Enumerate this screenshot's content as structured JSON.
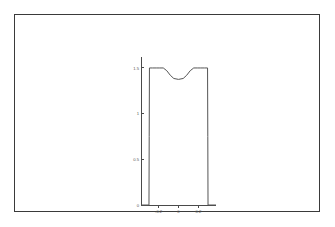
{
  "figure": {
    "title": "",
    "frame_color": "#3a3a3a",
    "background": "#ffffff",
    "line_color": "#555555"
  },
  "chart_data": {
    "type": "line",
    "title": "",
    "xlabel": "",
    "ylabel": "",
    "xlim": [
      -0.32,
      0.32
    ],
    "ylim": [
      0,
      1.62
    ],
    "grid": false,
    "legend": null,
    "xticks": [
      -0.2,
      0,
      0.2
    ],
    "xticklabels": [
      "-0.2",
      "0",
      "0.2"
    ],
    "yticks": [
      0,
      0.5,
      1,
      1.5
    ],
    "yticklabels": [
      "0",
      "0.5",
      "1",
      "1.5"
    ],
    "series": [
      {
        "name": "u(x)",
        "comment": "square-well profile: zero outside the support, flat near 1.5 with a shallow central dip",
        "x": [
          -0.32,
          -0.252,
          -0.25,
          -0.248,
          -0.22,
          -0.19,
          -0.16,
          -0.13,
          -0.1,
          -0.07,
          -0.04,
          0.0,
          0.04,
          0.07,
          0.1,
          0.13,
          0.16,
          0.19,
          0.22,
          0.248,
          0.25,
          0.252,
          0.32
        ],
        "y": [
          0.0,
          0.0,
          0.75,
          1.5,
          1.5,
          1.5,
          1.5,
          1.5,
          1.47,
          1.42,
          1.385,
          1.375,
          1.385,
          1.42,
          1.47,
          1.5,
          1.5,
          1.5,
          1.5,
          1.5,
          0.75,
          0.0,
          0.0
        ]
      }
    ]
  },
  "labels": {
    "y": {
      "t0": "0",
      "t1": "0.5",
      "t2": "1",
      "t3": "1.5"
    },
    "x": {
      "t0": "-0.2",
      "t1": "0",
      "t2": "0.2"
    }
  }
}
